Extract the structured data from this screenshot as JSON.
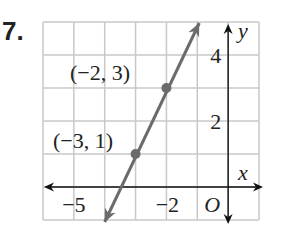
{
  "problem": {
    "number": "7."
  },
  "chart_data": {
    "type": "line",
    "title": "",
    "xlabel": "x",
    "ylabel": "y",
    "xlim": [
      -6,
      1
    ],
    "ylim": [
      -1,
      5
    ],
    "grid": true,
    "origin_label": "O",
    "x_tick_labels": [
      {
        "value": -5,
        "label": "−5"
      },
      {
        "value": -2,
        "label": "−2"
      }
    ],
    "y_tick_labels": [
      {
        "value": 4,
        "label": "4"
      },
      {
        "value": 2,
        "label": "2"
      }
    ],
    "series": [
      {
        "name": "line",
        "slope": 2,
        "intercept": 7,
        "x": [
          -4,
          -1
        ],
        "y": [
          -1,
          5
        ],
        "arrows": "both"
      }
    ],
    "points": [
      {
        "x": -2,
        "y": 3,
        "label": "(−2, 3)"
      },
      {
        "x": -3,
        "y": 1,
        "label": "(−3, 1)"
      }
    ],
    "colors": {
      "grid": "#c8c8c8",
      "line": "#6b6b6b",
      "axis": "#111111"
    }
  }
}
